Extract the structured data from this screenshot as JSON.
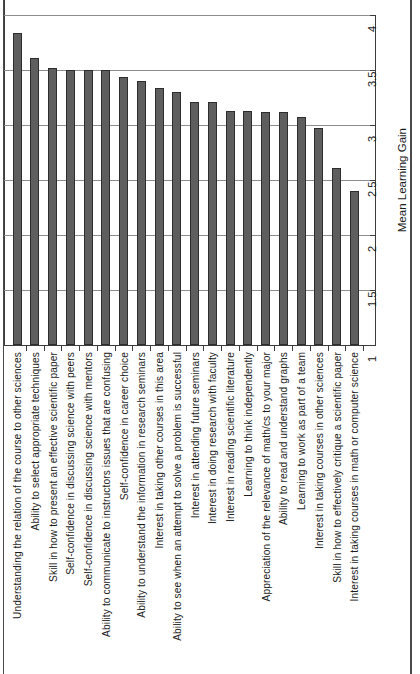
{
  "chart_data": {
    "type": "bar",
    "title": "",
    "subtitle": "",
    "orientation": "vertical-rotated",
    "xlabel": "",
    "ylabel": "Mean Learning Gain",
    "ylim": [
      1,
      4
    ],
    "ytick_labels": [
      "1",
      "1.5",
      "2",
      "2.5",
      "3",
      "3.5",
      "4"
    ],
    "ytick_values": [
      1,
      1.5,
      2,
      2.5,
      3,
      3.5,
      4
    ],
    "grid": true,
    "legend": false,
    "legend_position": "none",
    "categories": [
      "Understanding the relation of the course to other sciences",
      "Ability to select appropriate techniques",
      "Skill in how to present an effective scientific paper",
      "Self-confidence in discussing science with peers",
      "Self-confidence in discussing science with mentors",
      "Ability to communicate to instructors issues that are confusing",
      "Self-confidence in career choice",
      "Ability to understand the information in research seminars",
      "Interest in taking other courses in this area",
      "Ability to see when an attempt to solve a problem is successful",
      "Interest in attending future seminars",
      "Interest in doing research with faculty",
      "Interest in reading scientific literature",
      "Learning to think independently",
      "Appreciation of the relevance of math/cs to your major",
      "Ability to read and understand graphs",
      "Learning to work as part of a team",
      "Interest in taking courses in other sciences",
      "Skill in how to effectively critique a scientific paper",
      "Interest in taking courses in math or computer science"
    ],
    "values": [
      3.84,
      3.61,
      3.52,
      3.5,
      3.5,
      3.5,
      3.44,
      3.4,
      3.34,
      3.3,
      3.21,
      3.21,
      3.13,
      3.13,
      3.12,
      3.12,
      3.07,
      2.97,
      2.61,
      2.4
    ],
    "bar_color": "#5e5e5e",
    "bar_edge_color": "#2d2d2d",
    "grid_color": "#8d8d8d",
    "axis_color": "#3c3c3c",
    "background_color": "#ffffff"
  }
}
